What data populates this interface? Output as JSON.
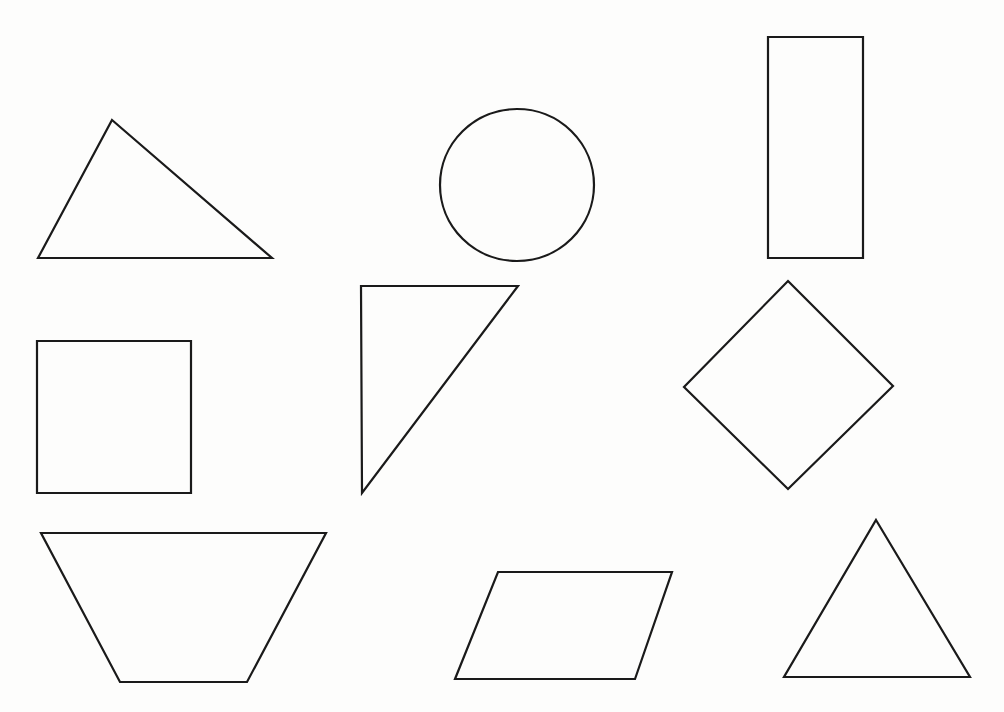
{
  "page": {
    "background_color": "#fdfdfc",
    "stroke_color": "#1a1a1a",
    "stroke_width": 2.2,
    "width": 1004,
    "height": 712,
    "grid": {
      "rows": 3,
      "columns": 3
    }
  },
  "chart_data": {
    "type": "scatter",
    "xlabel": "",
    "ylabel": "",
    "xlim": [
      0,
      1004
    ],
    "ylim": [
      0,
      712
    ],
    "grid": false,
    "legend": "none",
    "shapes": [
      {
        "id": "shape-1",
        "name": "scalene-triangle",
        "label": "Scalene triangle",
        "row": 1,
        "column": 1,
        "geometry": "polygon",
        "points": "112,120 272,258 38,258",
        "sides": 3,
        "bbox": [
          38,
          120,
          272,
          258
        ]
      },
      {
        "id": "shape-2",
        "name": "circle",
        "label": "Circle",
        "row": 1,
        "column": 2,
        "geometry": "ellipse",
        "cx": 517,
        "cy": 185,
        "rx": 77,
        "ry": 76,
        "sides": 0,
        "bbox": [
          440,
          109,
          594,
          261
        ]
      },
      {
        "id": "shape-3",
        "name": "vertical-rectangle",
        "label": "Rectangle",
        "row": 1,
        "column": 3,
        "geometry": "rect",
        "x": 768,
        "y": 37,
        "width": 95,
        "height": 221,
        "sides": 4,
        "bbox": [
          768,
          37,
          863,
          258
        ]
      },
      {
        "id": "shape-4",
        "name": "square",
        "label": "Square",
        "row": 2,
        "column": 1,
        "geometry": "rect",
        "x": 37,
        "y": 341,
        "width": 154,
        "height": 152,
        "sides": 4,
        "bbox": [
          37,
          341,
          191,
          493
        ]
      },
      {
        "id": "shape-5",
        "name": "right-triangle",
        "label": "Right triangle",
        "row": 2,
        "column": 2,
        "geometry": "polygon",
        "points": "361,286 518,286 362,493",
        "sides": 3,
        "bbox": [
          361,
          286,
          518,
          493
        ]
      },
      {
        "id": "shape-6",
        "name": "diamond-rhombus",
        "label": "Diamond",
        "row": 2,
        "column": 3,
        "geometry": "polygon",
        "points": "788,281 893,386 788,489 684,387",
        "sides": 4,
        "bbox": [
          684,
          281,
          893,
          489
        ]
      },
      {
        "id": "shape-7",
        "name": "inverted-trapezoid",
        "label": "Trapezoid",
        "row": 3,
        "column": 1,
        "geometry": "polygon",
        "points": "41,533 326,533 247,682 120,682",
        "sides": 4,
        "bbox": [
          41,
          533,
          326,
          682
        ]
      },
      {
        "id": "shape-8",
        "name": "parallelogram",
        "label": "Parallelogram",
        "row": 3,
        "column": 2,
        "geometry": "polygon",
        "points": "498,572 672,572 635,679 455,679",
        "sides": 4,
        "bbox": [
          455,
          572,
          672,
          679
        ]
      },
      {
        "id": "shape-9",
        "name": "equilateral-triangle",
        "label": "Equilateral triangle",
        "row": 3,
        "column": 3,
        "geometry": "polygon",
        "points": "876,520 970,677 784,677",
        "sides": 3,
        "bbox": [
          784,
          520,
          970,
          677
        ]
      }
    ]
  }
}
